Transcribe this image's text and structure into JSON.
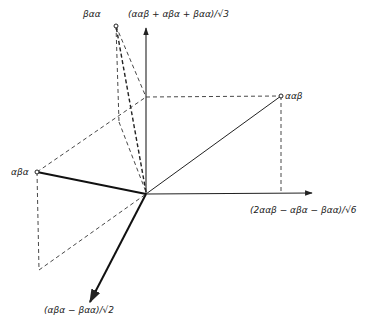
{
  "diagram": {
    "axes": {
      "vertical": {
        "label": "(ααβ + αβα + βαα)/√3"
      },
      "horizontal": {
        "label": "(2ααβ − αβα − βαα)/√6"
      },
      "diagonal": {
        "label": "(αβα − βαα)/√2"
      }
    },
    "points": {
      "beta_alpha_alpha": {
        "label": "βαα"
      },
      "alpha_alpha_beta": {
        "label": "ααβ"
      },
      "alpha_beta_alpha": {
        "label": "αβα"
      }
    },
    "colors": {
      "line": "#222222",
      "background": "#ffffff"
    }
  }
}
